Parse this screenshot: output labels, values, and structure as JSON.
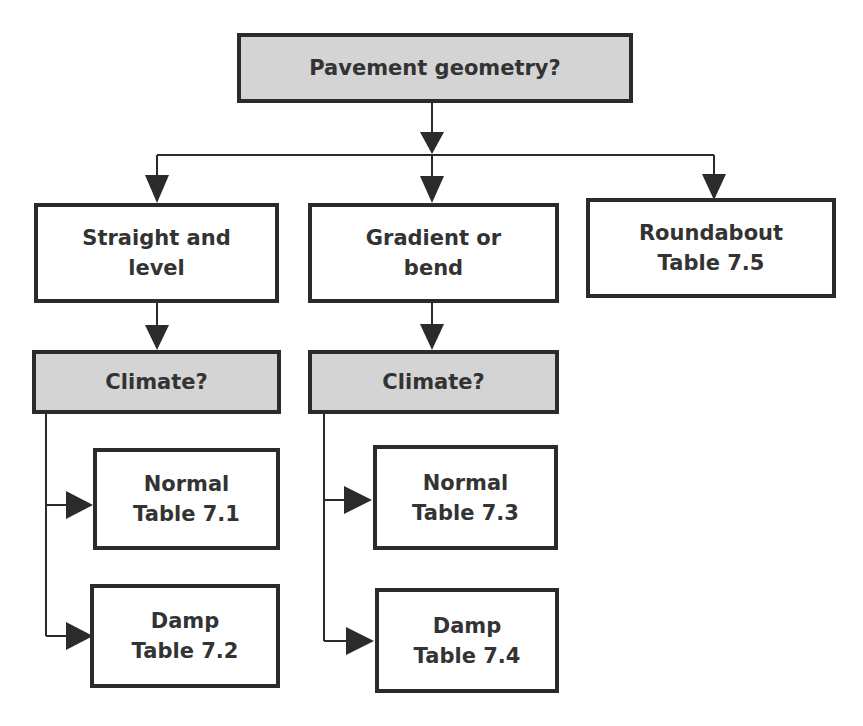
{
  "diagram": {
    "type": "flowchart",
    "root": {
      "label": "Pavement geometry?",
      "style": "question"
    },
    "branches": [
      {
        "label_lines": [
          "Straight and",
          "level"
        ],
        "child": {
          "label": "Climate?",
          "style": "question",
          "options": [
            {
              "lines": [
                "Normal",
                "Table 7.1"
              ]
            },
            {
              "lines": [
                "Damp",
                "Table 7.2"
              ]
            }
          ]
        }
      },
      {
        "label_lines": [
          "Gradient or",
          "bend"
        ],
        "child": {
          "label": "Climate?",
          "style": "question",
          "options": [
            {
              "lines": [
                "Normal",
                "Table 7.3"
              ]
            },
            {
              "lines": [
                "Damp",
                "Table 7.4"
              ]
            }
          ]
        }
      },
      {
        "label_lines": [
          "Roundabout",
          "Table 7.5"
        ]
      }
    ],
    "colors": {
      "question_fill": "#d4d4d4",
      "box_fill": "#ffffff",
      "border": "#2b2b2b",
      "text": "#333333"
    }
  }
}
